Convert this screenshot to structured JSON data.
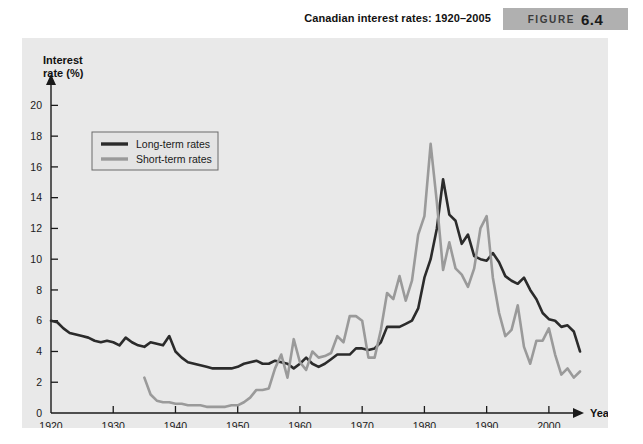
{
  "figure": {
    "title": "Canadian interest rates: 1920–2005",
    "badge_word": "FIGURE",
    "badge_number": "6.4",
    "badge_color": "#b0b0b0"
  },
  "chart_data": {
    "type": "line",
    "title": "Canadian interest rates: 1920–2005",
    "xlabel": "Year",
    "ylabel": "Interest rate (%)",
    "xlim": [
      1920,
      2005
    ],
    "ylim": [
      0,
      21
    ],
    "grid": false,
    "legend_position": "top-left",
    "xticks": [
      1920,
      1930,
      1940,
      1950,
      1960,
      1970,
      1980,
      1990,
      2000
    ],
    "yticks": [
      0,
      2,
      4,
      6,
      8,
      10,
      12,
      14,
      16,
      18,
      20
    ],
    "colors": {
      "long_term": "#2b2b2b",
      "short_term": "#9a9a9a",
      "panel_background": "#e9e9e9"
    },
    "series": [
      {
        "name": "Long-term rates",
        "color": "#2b2b2b",
        "x": [
          1920,
          1921,
          1922,
          1923,
          1924,
          1925,
          1926,
          1927,
          1928,
          1929,
          1930,
          1931,
          1932,
          1933,
          1934,
          1935,
          1936,
          1937,
          1938,
          1939,
          1940,
          1941,
          1942,
          1943,
          1944,
          1945,
          1946,
          1947,
          1948,
          1949,
          1950,
          1951,
          1952,
          1953,
          1954,
          1955,
          1956,
          1957,
          1958,
          1959,
          1960,
          1961,
          1962,
          1963,
          1964,
          1965,
          1966,
          1967,
          1968,
          1969,
          1970,
          1971,
          1972,
          1973,
          1974,
          1975,
          1976,
          1977,
          1978,
          1979,
          1980,
          1981,
          1982,
          1983,
          1984,
          1985,
          1986,
          1987,
          1988,
          1989,
          1990,
          1991,
          1992,
          1993,
          1994,
          1995,
          1996,
          1997,
          1998,
          1999,
          2000,
          2001,
          2002,
          2003,
          2004,
          2005
        ],
        "values": [
          6.0,
          5.9,
          5.5,
          5.2,
          5.1,
          5.0,
          4.9,
          4.7,
          4.6,
          4.7,
          4.6,
          4.4,
          4.9,
          4.6,
          4.4,
          4.3,
          4.6,
          4.5,
          4.4,
          5.0,
          4.0,
          3.6,
          3.3,
          3.2,
          3.1,
          3.0,
          2.9,
          2.9,
          2.9,
          2.9,
          3.0,
          3.2,
          3.3,
          3.4,
          3.2,
          3.2,
          3.4,
          3.3,
          3.2,
          2.9,
          3.2,
          3.6,
          3.2,
          3.0,
          3.2,
          3.5,
          3.8,
          3.8,
          3.8,
          4.2,
          4.2,
          4.1,
          4.2,
          4.6,
          5.6,
          5.6,
          5.6,
          5.8,
          6.0,
          6.8,
          8.8,
          10.0,
          12.0,
          15.2,
          12.9,
          12.5,
          11.0,
          11.6,
          10.2,
          10.0,
          9.9,
          10.4,
          9.8,
          8.9,
          8.6,
          8.4,
          8.8,
          8.0,
          7.4,
          6.5,
          6.1,
          6.0,
          5.6,
          5.7,
          5.3,
          4.0
        ]
      },
      {
        "name": "Short-term rates",
        "color": "#9a9a9a",
        "x": [
          1935,
          1936,
          1937,
          1938,
          1939,
          1940,
          1941,
          1942,
          1943,
          1944,
          1945,
          1946,
          1947,
          1948,
          1949,
          1950,
          1951,
          1952,
          1953,
          1954,
          1955,
          1956,
          1957,
          1958,
          1959,
          1960,
          1961,
          1962,
          1963,
          1964,
          1965,
          1966,
          1967,
          1968,
          1969,
          1970,
          1971,
          1972,
          1973,
          1974,
          1975,
          1976,
          1977,
          1978,
          1979,
          1980,
          1981,
          1982,
          1983,
          1984,
          1985,
          1986,
          1987,
          1988,
          1989,
          1990,
          1991,
          1992,
          1993,
          1994,
          1995,
          1996,
          1997,
          1998,
          1999,
          2000,
          2001,
          2002,
          2003,
          2004,
          2005
        ],
        "values": [
          2.3,
          1.2,
          0.8,
          0.7,
          0.7,
          0.6,
          0.6,
          0.5,
          0.5,
          0.5,
          0.4,
          0.4,
          0.4,
          0.4,
          0.5,
          0.5,
          0.7,
          1.0,
          1.5,
          1.5,
          1.6,
          2.9,
          3.8,
          2.3,
          4.8,
          3.3,
          2.8,
          4.0,
          3.6,
          3.7,
          3.9,
          5.0,
          4.6,
          6.3,
          6.3,
          6.0,
          3.6,
          3.6,
          5.4,
          7.8,
          7.4,
          8.9,
          7.3,
          8.6,
          11.6,
          12.8,
          17.5,
          13.7,
          9.3,
          11.1,
          9.4,
          9.0,
          8.2,
          9.4,
          12.0,
          12.8,
          8.8,
          6.5,
          5.0,
          5.4,
          7.0,
          4.3,
          3.2,
          4.7,
          4.7,
          5.5,
          3.8,
          2.5,
          2.9,
          2.3,
          2.7
        ]
      }
    ]
  },
  "legend": {
    "items": [
      {
        "label": "Long-term rates",
        "color": "#2b2b2b"
      },
      {
        "label": "Short-term rates",
        "color": "#9a9a9a"
      }
    ]
  }
}
